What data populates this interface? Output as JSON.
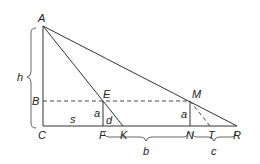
{
  "diagram": {
    "type": "geometry-similar-triangles",
    "points": {
      "A": {
        "label": "A",
        "x": 43,
        "y": 26
      },
      "B": {
        "label": "B",
        "x": 43,
        "y": 101
      },
      "C": {
        "label": "C",
        "x": 43,
        "y": 126
      },
      "E": {
        "label": "E",
        "x": 103,
        "y": 101
      },
      "F": {
        "label": "F",
        "x": 103,
        "y": 126
      },
      "K": {
        "label": "K",
        "x": 123,
        "y": 126
      },
      "M": {
        "label": "M",
        "x": 190,
        "y": 101
      },
      "N": {
        "label": "N",
        "x": 190,
        "y": 126
      },
      "T": {
        "label": "T",
        "x": 210,
        "y": 126
      },
      "R": {
        "label": "R",
        "x": 237,
        "y": 126
      }
    },
    "segment_labels": {
      "h": "h",
      "s": "s",
      "a_left": "a",
      "d": "d",
      "a_right": "a",
      "b": "b",
      "c": "c"
    },
    "solid_segments": [
      "A-C",
      "C-R",
      "A-K",
      "A-R",
      "E-F",
      "M-N"
    ],
    "dashed_segments": [
      "B-M",
      "M-T"
    ],
    "braces": [
      {
        "label": "h",
        "from": "A",
        "to": "C",
        "side": "left"
      },
      {
        "label": "b",
        "from": "F",
        "to": "N",
        "side": "below"
      },
      {
        "label": "c",
        "from": "N",
        "to": "R",
        "side": "below"
      }
    ]
  }
}
